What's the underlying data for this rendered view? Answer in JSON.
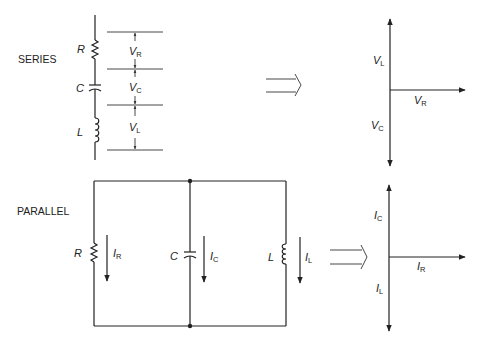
{
  "series": {
    "section_label": "SERIES",
    "components": [
      {
        "symbol": "R",
        "type": "resistor"
      },
      {
        "symbol": "C",
        "type": "capacitor"
      },
      {
        "symbol": "L",
        "type": "inductor"
      }
    ],
    "voltage_drops": [
      {
        "symbol": "V",
        "sub": "R"
      },
      {
        "symbol": "V",
        "sub": "C"
      },
      {
        "symbol": "V",
        "sub": "L"
      }
    ],
    "phasor": {
      "up": {
        "symbol": "V",
        "sub": "L"
      },
      "right": {
        "symbol": "V",
        "sub": "R"
      },
      "down": {
        "symbol": "V",
        "sub": "C"
      }
    }
  },
  "parallel": {
    "section_label": "PARALLEL",
    "branches": [
      {
        "symbol": "R",
        "type": "resistor",
        "current": {
          "symbol": "I",
          "sub": "R"
        }
      },
      {
        "symbol": "C",
        "type": "capacitor",
        "current": {
          "symbol": "I",
          "sub": "C"
        }
      },
      {
        "symbol": "L",
        "type": "inductor",
        "current": {
          "symbol": "I",
          "sub": "L"
        }
      }
    ],
    "phasor": {
      "up": {
        "symbol": "I",
        "sub": "C"
      },
      "right": {
        "symbol": "I",
        "sub": "R"
      },
      "down": {
        "symbol": "I",
        "sub": "L"
      }
    }
  },
  "colors": {
    "line": "#222222",
    "background": "#ffffff"
  }
}
